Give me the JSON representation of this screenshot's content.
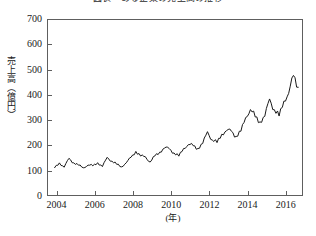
{
  "chart_data": {
    "type": "line",
    "title": "図表　ある企業の売上高の推移",
    "xlabel": "(年)",
    "ylabel": "売上高（億円）",
    "xlim": [
      2003.5,
      2016.9
    ],
    "ylim": [
      0,
      700
    ],
    "grid": false,
    "legend": null,
    "line_color": "#1a1a1a",
    "line_width": 1,
    "y_ticks": [
      0,
      100,
      200,
      300,
      400,
      500,
      600,
      700
    ],
    "y_tick_labels": [
      "0",
      "100",
      "200",
      "300",
      "400",
      "500",
      "600",
      "700"
    ],
    "x_ticks": [
      2004,
      2006,
      2008,
      2010,
      2012,
      2014,
      2016
    ],
    "x_tick_labels": [
      "2004",
      "2006",
      "2008",
      "2010",
      "2012",
      "2014",
      "2016"
    ],
    "series": [
      {
        "name": "売上高",
        "x": [
          2003.9,
          2004.15,
          2004.4,
          2004.65,
          2004.9,
          2005.15,
          2005.4,
          2005.65,
          2005.9,
          2006.15,
          2006.4,
          2006.65,
          2006.9,
          2007.15,
          2007.4,
          2007.65,
          2007.9,
          2008.15,
          2008.4,
          2008.65,
          2008.9,
          2009.15,
          2009.4,
          2009.65,
          2009.9,
          2010.15,
          2010.4,
          2010.65,
          2010.9,
          2011.15,
          2011.4,
          2011.65,
          2011.9,
          2012.15,
          2012.4,
          2012.65,
          2012.9,
          2013.15,
          2013.4,
          2013.65,
          2013.9,
          2014.15,
          2014.4,
          2014.65,
          2014.9,
          2015.15,
          2015.4,
          2015.65,
          2015.9,
          2016.15,
          2016.4,
          2016.65
        ],
        "values": [
          112,
          128,
          118,
          145,
          132,
          124,
          108,
          126,
          118,
          130,
          120,
          148,
          140,
          126,
          112,
          136,
          150,
          176,
          162,
          150,
          138,
          158,
          170,
          196,
          182,
          172,
          160,
          182,
          210,
          196,
          186,
          214,
          246,
          226,
          212,
          238,
          268,
          250,
          236,
          262,
          300,
          352,
          310,
          288,
          326,
          372,
          346,
          320,
          364,
          420,
          468,
          430
        ]
      }
    ],
    "series_detail_points": {
      "description": "monthly-resolution sales, strong annual seasonal peaks rising over time",
      "peak_values": [
        148,
        150,
        176,
        196,
        210,
        246,
        268,
        300,
        352,
        372,
        468,
        560,
        625
      ],
      "peak_years": [
        2004.9,
        2006.0,
        2007.0,
        2008.0,
        2009.0,
        2010.0,
        2011.0,
        2012.0,
        2013.0,
        2014.0,
        2015.0,
        2015.6,
        2016.2
      ],
      "min_value": 105,
      "max_value": 625,
      "start_value": 112,
      "end_value": 430
    }
  }
}
